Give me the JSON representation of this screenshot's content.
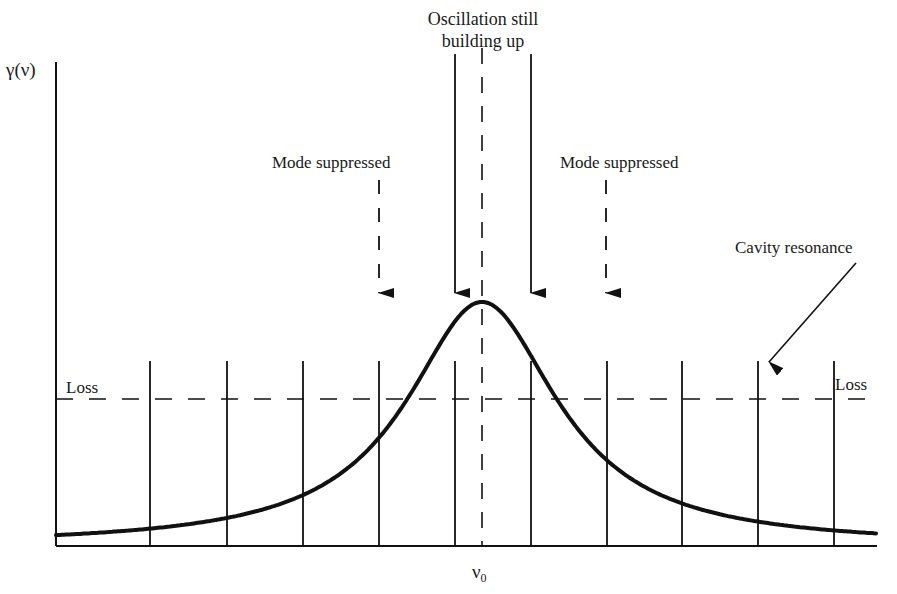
{
  "labels": {
    "y_axis": "γ(ν)",
    "x_center_symbol": "ν",
    "x_center_subscript": "0",
    "oscillation_line1": "Oscillation still",
    "oscillation_line2": "building up",
    "mode_suppressed_left": "Mode suppressed",
    "mode_suppressed_right": "Mode suppressed",
    "cavity_resonance": "Cavity resonance",
    "loss_left": "Loss",
    "loss_right": "Loss"
  },
  "colors": {
    "ink": "#111111",
    "background": "#ffffff"
  },
  "geometry": {
    "axis_origin": [
      56,
      546
    ],
    "y_axis_top": 62,
    "x_axis_right": 877,
    "peak": [
      482,
      302
    ],
    "loss_level_y": 399,
    "mode_line_top_y": 361,
    "mode_lines_x": [
      150,
      227,
      303,
      379,
      455,
      531,
      607,
      682,
      758,
      834
    ],
    "center_line_x": 482,
    "solid_arrows_x": [
      455,
      531
    ],
    "dashed_arrows_x": [
      379,
      606
    ],
    "arrow_tip_y": 293,
    "cavity_arrow": {
      "from": [
        856,
        263
      ],
      "to": [
        769,
        362
      ]
    }
  },
  "chart_data": {
    "type": "line",
    "title": "",
    "xlabel": "ν",
    "ylabel": "γ(ν)",
    "x_ticks": [
      "ν0"
    ],
    "series": [
      {
        "name": "gain curve γ(ν) (pixel coords)",
        "x": [
          56,
          150,
          227,
          303,
          379,
          420,
          455,
          482,
          510,
          531,
          560,
          607,
          682,
          758,
          834,
          877
        ],
        "y": [
          527,
          515,
          497,
          468,
          410,
          350,
          314,
          302,
          314,
          336,
          375,
          430,
          480,
          503,
          518,
          526
        ]
      }
    ],
    "loss_level": "horizontal dashed line labeled 'Loss' on both ends",
    "cavity_modes": 10,
    "annotations": [
      {
        "text": "Oscillation still building up",
        "points_to_modes_x": [
          455,
          531
        ],
        "style": "solid arrows"
      },
      {
        "text": "Mode suppressed",
        "points_to_modes_x": [
          379
        ],
        "style": "dashed arrow"
      },
      {
        "text": "Mode suppressed",
        "points_to_modes_x": [
          606
        ],
        "style": "dashed arrow"
      },
      {
        "text": "Cavity resonance",
        "points_to_modes_x": [
          758
        ],
        "style": "diagonal arrow"
      }
    ],
    "grid": false,
    "legend": "none"
  }
}
